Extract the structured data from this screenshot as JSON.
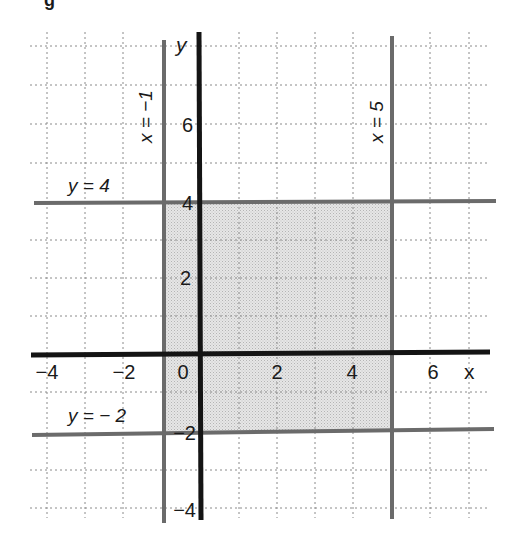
{
  "figure": {
    "caption_fragment": "g",
    "axes": {
      "x_label": "x",
      "y_label": "y",
      "x_ticks": [
        {
          "value": -4,
          "label": "−4"
        },
        {
          "value": -2,
          "label": "−2"
        },
        {
          "value": 0,
          "label": "0"
        },
        {
          "value": 2,
          "label": "2"
        },
        {
          "value": 4,
          "label": "4"
        },
        {
          "value": 6,
          "label": "6"
        }
      ],
      "y_ticks": [
        {
          "value": 6,
          "label": "6"
        },
        {
          "value": 4,
          "label": "4"
        },
        {
          "value": 2,
          "label": "2"
        },
        {
          "value": -2,
          "label": "−2"
        },
        {
          "value": -4,
          "label": "−4"
        }
      ],
      "x_range": [
        -4,
        7
      ],
      "y_range": [
        -4,
        8
      ],
      "grid": "dotted, unit spacing"
    },
    "boundary_lines": [
      {
        "id": "x-eq-neg1",
        "equation": "x = −1",
        "type": "vertical",
        "value": -1
      },
      {
        "id": "x-eq-5",
        "equation": "x = 5",
        "type": "vertical",
        "value": 5
      },
      {
        "id": "y-eq-4",
        "equation": "y = 4",
        "type": "horizontal",
        "value": 4
      },
      {
        "id": "y-eq-neg2",
        "equation": "y = − 2",
        "type": "horizontal",
        "value": -2
      }
    ],
    "shaded_region": {
      "description": "Rectangle bounded by x = -1, x = 5, y = -2, y = 4",
      "x_min": -1,
      "x_max": 5,
      "y_min": -2,
      "y_max": 4
    },
    "colors": {
      "axis": "#141414",
      "boundary": "#6b6b6b",
      "grid": "#8a8a8a",
      "shade": "#d9d9d9"
    }
  }
}
